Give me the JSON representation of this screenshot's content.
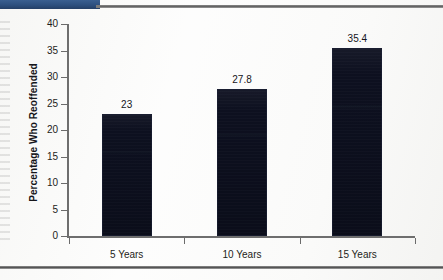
{
  "page": {
    "background_color": "#fbfbfa",
    "banner_color": "#2f5384",
    "rule_color": "#6e6e6e"
  },
  "chart_data": {
    "type": "bar",
    "title": "",
    "subtitle": "",
    "xlabel": "",
    "ylabel": "Percentage Who Reoffended",
    "categories": [
      "5 Years",
      "10 Years",
      "15 Years"
    ],
    "values": [
      23,
      27.8,
      35.4
    ],
    "value_labels": [
      "23",
      "27.8",
      "35.4"
    ],
    "ylim": [
      0,
      40
    ],
    "yticks": [
      0,
      5,
      10,
      15,
      20,
      25,
      30,
      35,
      40
    ],
    "ytick_labels": [
      "0",
      "5",
      "10",
      "15",
      "20",
      "25",
      "30",
      "35",
      "40"
    ],
    "grid": false,
    "legend": false,
    "legend_position": "none",
    "bar_color": "#0d1020",
    "series": [
      {
        "name": "Percentage Who Reoffended",
        "values": [
          23,
          27.8,
          35.4
        ]
      }
    ]
  }
}
